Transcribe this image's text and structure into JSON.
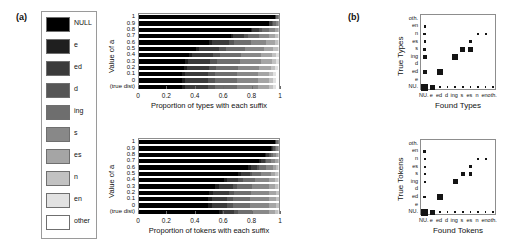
{
  "figure": {
    "panel_a_label": "(a)",
    "panel_b_label": "(b)"
  },
  "legend": {
    "items": [
      {
        "label": "NULL",
        "color": "#000000"
      },
      {
        "label": "e",
        "color": "#1f1f1f"
      },
      {
        "label": "ed",
        "color": "#3b3b3b"
      },
      {
        "label": "d",
        "color": "#565656"
      },
      {
        "label": "ing",
        "color": "#6e6e6e"
      },
      {
        "label": "s",
        "color": "#888888"
      },
      {
        "label": "es",
        "color": "#a5a5a5"
      },
      {
        "label": "n",
        "color": "#c2c2c2"
      },
      {
        "label": "en",
        "color": "#e2e2e2"
      },
      {
        "label": "other",
        "color": "#ffffff"
      }
    ]
  },
  "chart_data": [
    {
      "type": "bar",
      "name": "types-stacked-bar",
      "orientation": "horizontal",
      "stacked": true,
      "title": "",
      "xlabel": "Proportion of types with each suffix",
      "ylabel": "Value of a",
      "xlim": [
        0,
        1
      ],
      "xticks": [
        0,
        0.2,
        0.4,
        0.6,
        0.8,
        1
      ],
      "xticklabels": [
        "0",
        "0.2",
        "0.4",
        "0.6",
        "0.8",
        "1"
      ],
      "grid": false,
      "legend_position": "external-left",
      "categories": [
        "1",
        "0.9",
        "0.8",
        "0.7",
        "0.6",
        "0.5",
        "0.4",
        "0.3",
        "0.2",
        "0.1",
        "0",
        "(true dist)"
      ],
      "series": [
        {
          "name": "NULL",
          "values": [
            0.97,
            0.93,
            0.8,
            0.66,
            0.5,
            0.41,
            0.36,
            0.33,
            0.32,
            0.31,
            0.31,
            0.31
          ]
        },
        {
          "name": "e",
          "values": [
            0.0,
            0.0,
            0.01,
            0.01,
            0.02,
            0.02,
            0.02,
            0.02,
            0.02,
            0.02,
            0.02,
            0.02
          ]
        },
        {
          "name": "ed",
          "values": [
            0.01,
            0.02,
            0.05,
            0.08,
            0.12,
            0.14,
            0.15,
            0.16,
            0.16,
            0.16,
            0.16,
            0.16
          ]
        },
        {
          "name": "d",
          "values": [
            0.0,
            0.01,
            0.02,
            0.03,
            0.04,
            0.05,
            0.05,
            0.05,
            0.05,
            0.05,
            0.05,
            0.05
          ]
        },
        {
          "name": "ing",
          "values": [
            0.01,
            0.02,
            0.05,
            0.08,
            0.12,
            0.14,
            0.15,
            0.16,
            0.16,
            0.16,
            0.16,
            0.16
          ]
        },
        {
          "name": "s",
          "values": [
            0.01,
            0.01,
            0.04,
            0.07,
            0.11,
            0.13,
            0.14,
            0.15,
            0.15,
            0.15,
            0.15,
            0.15
          ]
        },
        {
          "name": "es",
          "values": [
            0.0,
            0.01,
            0.02,
            0.04,
            0.06,
            0.07,
            0.08,
            0.08,
            0.08,
            0.08,
            0.08,
            0.08
          ]
        },
        {
          "name": "n",
          "values": [
            0.0,
            0.0,
            0.01,
            0.02,
            0.02,
            0.03,
            0.03,
            0.03,
            0.03,
            0.03,
            0.03,
            0.03
          ]
        },
        {
          "name": "en",
          "values": [
            0.0,
            0.0,
            0.0,
            0.01,
            0.01,
            0.01,
            0.02,
            0.02,
            0.02,
            0.02,
            0.02,
            0.02
          ]
        },
        {
          "name": "other",
          "values": [
            0.0,
            0.0,
            0.0,
            0.0,
            0.0,
            0.0,
            0.0,
            0.0,
            0.01,
            0.02,
            0.02,
            0.02
          ]
        }
      ]
    },
    {
      "type": "bar",
      "name": "tokens-stacked-bar",
      "orientation": "horizontal",
      "stacked": true,
      "title": "",
      "xlabel": "Proportion of tokens with each suffix",
      "ylabel": "Value of a",
      "xlim": [
        0,
        1
      ],
      "xticks": [
        0,
        0.2,
        0.4,
        0.6,
        0.8,
        1
      ],
      "xticklabels": [
        "0",
        "0.2",
        "0.4",
        "0.6",
        "0.8",
        "1"
      ],
      "grid": false,
      "legend_position": "external-left",
      "categories": [
        "1",
        "0.9",
        "0.8",
        "0.7",
        "0.6",
        "0.5",
        "0.4",
        "0.3",
        "0.2",
        "0.1",
        "0",
        "(true dist)"
      ],
      "series": [
        {
          "name": "NULL",
          "values": [
            0.97,
            0.94,
            0.9,
            0.86,
            0.78,
            0.71,
            0.61,
            0.54,
            0.5,
            0.49,
            0.49,
            0.57
          ]
        },
        {
          "name": "e",
          "values": [
            0.0,
            0.01,
            0.01,
            0.01,
            0.02,
            0.02,
            0.02,
            0.03,
            0.03,
            0.03,
            0.03,
            0.02
          ]
        },
        {
          "name": "ed",
          "values": [
            0.01,
            0.01,
            0.02,
            0.03,
            0.04,
            0.06,
            0.08,
            0.1,
            0.11,
            0.11,
            0.11,
            0.09
          ]
        },
        {
          "name": "d",
          "values": [
            0.0,
            0.01,
            0.01,
            0.01,
            0.02,
            0.02,
            0.03,
            0.03,
            0.04,
            0.04,
            0.04,
            0.03
          ]
        },
        {
          "name": "ing",
          "values": [
            0.01,
            0.01,
            0.02,
            0.03,
            0.05,
            0.06,
            0.09,
            0.11,
            0.12,
            0.12,
            0.12,
            0.1
          ]
        },
        {
          "name": "s",
          "values": [
            0.01,
            0.01,
            0.02,
            0.03,
            0.05,
            0.07,
            0.1,
            0.12,
            0.13,
            0.14,
            0.14,
            0.12
          ]
        },
        {
          "name": "es",
          "values": [
            0.0,
            0.01,
            0.01,
            0.02,
            0.02,
            0.03,
            0.04,
            0.04,
            0.05,
            0.05,
            0.05,
            0.04
          ]
        },
        {
          "name": "n",
          "values": [
            0.0,
            0.0,
            0.01,
            0.01,
            0.01,
            0.02,
            0.02,
            0.02,
            0.02,
            0.02,
            0.02,
            0.02
          ]
        },
        {
          "name": "en",
          "values": [
            0.0,
            0.0,
            0.0,
            0.0,
            0.01,
            0.01,
            0.01,
            0.01,
            0.0,
            0.0,
            0.0,
            0.01
          ]
        },
        {
          "name": "other",
          "values": [
            0.0,
            0.0,
            0.0,
            0.0,
            0.0,
            0.0,
            0.0,
            0.0,
            0.0,
            0.0,
            0.0,
            0.0
          ]
        }
      ]
    },
    {
      "type": "heatmap",
      "name": "types-confusion-matrix",
      "style": "hinton",
      "title": "",
      "xlabel": "Found Types",
      "ylabel": "True Types",
      "xticklabels": [
        "NU.",
        "e",
        "ed",
        "d",
        "ing",
        "s",
        "es",
        "n",
        "en",
        "oth."
      ],
      "yticklabels": [
        "NU.",
        "e",
        "ed",
        "d",
        "ing",
        "s",
        "es",
        "n",
        "en",
        "oth."
      ],
      "grid": false,
      "cells": [
        {
          "row": "NU.",
          "col": "NU.",
          "value": 0.95
        },
        {
          "row": "NU.",
          "col": "e",
          "value": 0.48
        },
        {
          "row": "NU.",
          "col": "ed",
          "value": 0.04
        },
        {
          "row": "NU.",
          "col": "d",
          "value": 0.04
        },
        {
          "row": "NU.",
          "col": "ing",
          "value": 0.04
        },
        {
          "row": "NU.",
          "col": "s",
          "value": 0.04
        },
        {
          "row": "NU.",
          "col": "es",
          "value": 0.04
        },
        {
          "row": "NU.",
          "col": "n",
          "value": 0.04
        },
        {
          "row": "NU.",
          "col": "en",
          "value": 0.04
        },
        {
          "row": "NU.",
          "col": "oth.",
          "value": 0.04
        },
        {
          "row": "ed",
          "col": "NU.",
          "value": 0.36
        },
        {
          "row": "ed",
          "col": "ed",
          "value": 0.72
        },
        {
          "row": "ing",
          "col": "NU.",
          "value": 0.22
        },
        {
          "row": "ing",
          "col": "ing",
          "value": 0.62
        },
        {
          "row": "s",
          "col": "NU.",
          "value": 0.2
        },
        {
          "row": "s",
          "col": "s",
          "value": 0.48
        },
        {
          "row": "s",
          "col": "es",
          "value": 0.44
        },
        {
          "row": "es",
          "col": "NU.",
          "value": 0.1
        },
        {
          "row": "es",
          "col": "es",
          "value": 0.14
        },
        {
          "row": "n",
          "col": "NU.",
          "value": 0.14
        },
        {
          "row": "n",
          "col": "n",
          "value": 0.07
        },
        {
          "row": "n",
          "col": "en",
          "value": 0.07
        },
        {
          "row": "en",
          "col": "NU.",
          "value": 0.12
        }
      ]
    },
    {
      "type": "heatmap",
      "name": "tokens-confusion-matrix",
      "style": "hinton",
      "title": "",
      "xlabel": "Found Tokens",
      "ylabel": "True Tokens",
      "xticklabels": [
        "NU.",
        "e",
        "ed",
        "d",
        "ing",
        "s",
        "es",
        "n",
        "en",
        "oth."
      ],
      "yticklabels": [
        "NU.",
        "e",
        "ed",
        "d",
        "ing",
        "s",
        "es",
        "n",
        "en",
        "oth."
      ],
      "grid": false,
      "cells": [
        {
          "row": "NU.",
          "col": "NU.",
          "value": 0.98
        },
        {
          "row": "NU.",
          "col": "e",
          "value": 0.42
        },
        {
          "row": "NU.",
          "col": "ed",
          "value": 0.05
        },
        {
          "row": "NU.",
          "col": "d",
          "value": 0.05
        },
        {
          "row": "NU.",
          "col": "ing",
          "value": 0.05
        },
        {
          "row": "NU.",
          "col": "s",
          "value": 0.05
        },
        {
          "row": "NU.",
          "col": "es",
          "value": 0.05
        },
        {
          "row": "NU.",
          "col": "n",
          "value": 0.05
        },
        {
          "row": "NU.",
          "col": "en",
          "value": 0.05
        },
        {
          "row": "NU.",
          "col": "oth.",
          "value": 0.05
        },
        {
          "row": "ed",
          "col": "NU.",
          "value": 0.13
        },
        {
          "row": "ed",
          "col": "ed",
          "value": 0.52
        },
        {
          "row": "ing",
          "col": "NU.",
          "value": 0.12
        },
        {
          "row": "ing",
          "col": "ing",
          "value": 0.45
        },
        {
          "row": "s",
          "col": "NU.",
          "value": 0.11
        },
        {
          "row": "s",
          "col": "s",
          "value": 0.38
        },
        {
          "row": "s",
          "col": "es",
          "value": 0.22
        },
        {
          "row": "es",
          "col": "NU.",
          "value": 0.08
        },
        {
          "row": "es",
          "col": "es",
          "value": 0.13
        },
        {
          "row": "n",
          "col": "NU.",
          "value": 0.09
        },
        {
          "row": "n",
          "col": "n",
          "value": 0.07
        },
        {
          "row": "n",
          "col": "en",
          "value": 0.07
        },
        {
          "row": "en",
          "col": "NU.",
          "value": 0.2
        }
      ]
    }
  ]
}
